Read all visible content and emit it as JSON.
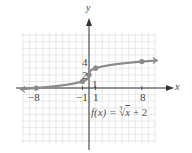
{
  "chart_data": {
    "type": "line",
    "title": "",
    "function_label": "f(x) = ∛x + 2",
    "function_parts": {
      "fx": "f(x) = ",
      "root_index": "3",
      "radicand": "x",
      "tail": " + 2"
    },
    "xlabel": "x",
    "ylabel": "y",
    "xlim": [
      -10,
      10
    ],
    "ylim": [
      -8,
      8
    ],
    "grid": true,
    "x_ticks_labeled": [
      "-8",
      "-1",
      "1",
      "8"
    ],
    "y_ticks_labeled": [
      "1",
      "2",
      "4"
    ],
    "points": [
      {
        "x": -8,
        "y": 0
      },
      {
        "x": -1,
        "y": 1
      },
      {
        "x": 0,
        "y": 2
      },
      {
        "x": 1,
        "y": 3
      },
      {
        "x": 8,
        "y": 4
      }
    ],
    "curve_color": "#8a8a8a",
    "point_color": "#8a8a8a",
    "grid_color": "#e2e2e2",
    "axis_color": "#333333"
  },
  "labels": {
    "x_axis": "x",
    "y_axis": "y",
    "tick_neg8": "−8",
    "tick_neg1": "−1",
    "tick_1": "1",
    "tick_8": "8",
    "y_tick_1": "1",
    "y_tick_2": "2",
    "y_tick_4": "4"
  }
}
